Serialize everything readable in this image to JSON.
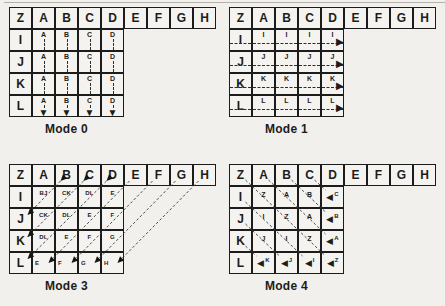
{
  "figure": {
    "colors": {
      "paper": "#f2f0ec",
      "ink": "#1c1c1c",
      "dash": "#3a3a3a"
    }
  },
  "icons": {
    "arrow_down": "▼",
    "arrow_right": "▶",
    "arrow_left": "◀"
  },
  "modes": [
    {
      "caption": "Mode 0",
      "flow": "down",
      "header": [
        "Z",
        "A",
        "B",
        "C",
        "D",
        "E",
        "F",
        "G",
        "H"
      ],
      "row_labels": [
        "I",
        "J",
        "K",
        "L"
      ],
      "cells": [
        [
          "A",
          "B",
          "C",
          "D"
        ],
        [
          "A",
          "B",
          "C",
          "D"
        ],
        [
          "A",
          "B",
          "C",
          "D"
        ],
        [
          "A",
          "B",
          "C",
          "D"
        ]
      ]
    },
    {
      "caption": "Mode 1",
      "flow": "right",
      "header": [
        "Z",
        "A",
        "B",
        "C",
        "D",
        "E",
        "F",
        "G",
        "H"
      ],
      "row_labels": [
        "I",
        "J",
        "K",
        "L"
      ],
      "cells": [
        [
          "I",
          "I",
          "I",
          "I"
        ],
        [
          "J",
          "J",
          "J",
          "J"
        ],
        [
          "K",
          "K",
          "K",
          "K"
        ],
        [
          "L",
          "L",
          "L",
          "L"
        ]
      ]
    },
    {
      "caption": "Mode 3",
      "flow": "antidiagonal",
      "header": [
        "Z",
        "A",
        "B",
        "C",
        "D",
        "E",
        "F",
        "G",
        "H"
      ],
      "row_labels": [
        "I",
        "J",
        "K",
        "L"
      ],
      "cells": [
        [
          "BJ",
          "CK",
          "DL",
          "E"
        ],
        [
          "CK",
          "DL",
          "E",
          "F"
        ],
        [
          "DL",
          "E",
          "F",
          "G"
        ],
        [
          "E",
          "F",
          "G",
          "H"
        ]
      ]
    },
    {
      "caption": "Mode 4",
      "flow": "diagonal",
      "header": [
        "Z",
        "A",
        "B",
        "C",
        "D",
        "E",
        "F",
        "G",
        "H"
      ],
      "row_labels": [
        "I",
        "J",
        "K",
        "L"
      ],
      "cells": [
        [
          "Z",
          "A",
          "B",
          "C"
        ],
        [
          "I",
          "Z",
          "A",
          "B"
        ],
        [
          "J",
          "I",
          "Z",
          "A"
        ],
        [
          "K",
          "J",
          "I",
          "Z"
        ]
      ]
    }
  ]
}
